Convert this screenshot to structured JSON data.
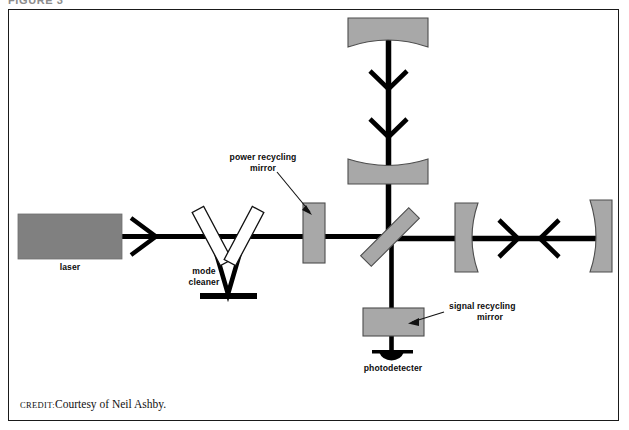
{
  "figure": {
    "top_cut_text": "FIGURE 3",
    "credit_keyword": "CREDIT:",
    "credit_text": "Courtesy of Neil Ashby.",
    "border_color": "#1a1a1a",
    "beam_color": "#000000",
    "mirror_fill": "#a8a8a8",
    "mirror_stroke": "#555555",
    "laser_fill": "#808080",
    "background": "#ffffff"
  },
  "labels": {
    "laser": "laser",
    "mode_cleaner_line1": "mode",
    "mode_cleaner_line2": "cleaner",
    "power_recycling_line1": "power recycling",
    "power_recycling_line2": "mirror",
    "signal_recycling_line1": "signal recycling",
    "signal_recycling_line2": "mirror",
    "photodetector": "photodetecter"
  },
  "components": [
    {
      "name": "laser-source",
      "type": "block",
      "fill": "#808080"
    },
    {
      "name": "mode-cleaner-mirror-left",
      "type": "tilted-mirror",
      "fill": "#ffffff"
    },
    {
      "name": "mode-cleaner-mirror-right",
      "type": "tilted-mirror",
      "fill": "#ffffff"
    },
    {
      "name": "mode-cleaner-end-mirror",
      "type": "bar",
      "fill": "#000000"
    },
    {
      "name": "power-recycling-mirror",
      "type": "vertical-slab",
      "fill": "#a8a8a8"
    },
    {
      "name": "beam-splitter",
      "type": "tilted-slab",
      "fill": "#a8a8a8"
    },
    {
      "name": "vertical-arm-near-mirror",
      "type": "curved-mirror",
      "fill": "#a8a8a8"
    },
    {
      "name": "vertical-arm-far-mirror",
      "type": "curved-mirror",
      "fill": "#a8a8a8"
    },
    {
      "name": "horizontal-arm-near-mirror",
      "type": "curved-mirror",
      "fill": "#a8a8a8"
    },
    {
      "name": "horizontal-arm-far-mirror",
      "type": "curved-mirror",
      "fill": "#a8a8a8"
    },
    {
      "name": "signal-recycling-mirror",
      "type": "horizontal-slab",
      "fill": "#a8a8a8"
    },
    {
      "name": "photodetector",
      "type": "half-disc",
      "fill": "#000000"
    }
  ],
  "beams": [
    {
      "name": "laser-to-mode-cleaner",
      "orientation": "horizontal"
    },
    {
      "name": "mode-cleaner-v-path",
      "orientation": "diagonal"
    },
    {
      "name": "mode-cleaner-to-beamsplitter",
      "orientation": "horizontal"
    },
    {
      "name": "vertical-arm-beam",
      "orientation": "vertical"
    },
    {
      "name": "horizontal-arm-beam",
      "orientation": "horizontal"
    },
    {
      "name": "output-beam-to-photodetector",
      "orientation": "vertical"
    }
  ]
}
